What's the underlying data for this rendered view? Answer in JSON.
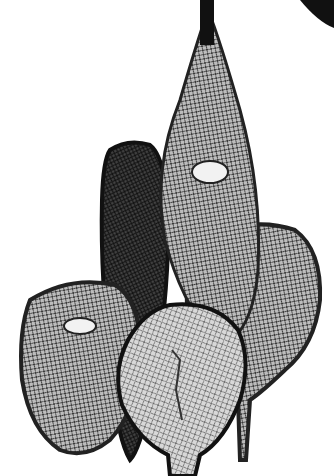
{
  "image": {
    "subject": "snowshoes",
    "style": "black-and-white photograph",
    "background": "#ffffff",
    "ink": "#111111",
    "mesh": "#8a8a8a",
    "items": [
      {
        "name": "tall-pointed-snowshoe",
        "position": "center-top"
      },
      {
        "name": "dark-narrow-snowshoe",
        "position": "center-left"
      },
      {
        "name": "right-oval-snowshoe",
        "position": "right"
      },
      {
        "name": "left-round-snowshoe",
        "position": "left"
      },
      {
        "name": "front-round-snowshoe",
        "position": "bottom-center"
      }
    ]
  }
}
